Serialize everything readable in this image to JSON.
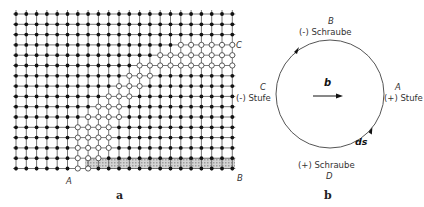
{
  "panel_a": {
    "caption": "a",
    "points": {
      "A": "A",
      "B": "B",
      "C": "C"
    },
    "grid": {
      "cols": 22,
      "rows": 16,
      "x0": 16,
      "y0": 14,
      "spacing": 10.3
    }
  },
  "panel_b": {
    "caption": "b",
    "vector_label": "b",
    "line_element_label": "ds",
    "top": {
      "point": "B",
      "label": "(-) Schraube"
    },
    "bottom": {
      "point": "D",
      "label": "(+) Schraube"
    },
    "left": {
      "point": "C",
      "label": "(-) Stufe"
    },
    "right": {
      "point": "A",
      "label": "(+) Stufe"
    }
  },
  "colors": {
    "line": "#444444",
    "atom": "#111111",
    "hatch": "#bdbdbd"
  }
}
